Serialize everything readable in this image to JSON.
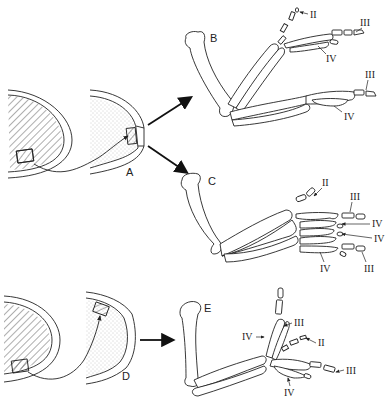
{
  "figure": {
    "panels": [
      {
        "id": "A",
        "label": "A",
        "content": "donor limb bud (hatched) with posterior tissue grafted into anterior margin of host limb bud (stippled)"
      },
      {
        "id": "B",
        "label": "B",
        "content": "resulting wing skeleton with mirror-duplicated digits",
        "digit_labels": [
          "II",
          "III",
          "IV",
          "III",
          "IV"
        ]
      },
      {
        "id": "C",
        "label": "C",
        "content": "resulting wing skeleton with multiple duplicated digits",
        "digit_labels": [
          "II",
          "III",
          "IV",
          "IV",
          "IV",
          "III"
        ]
      },
      {
        "id": "D",
        "label": "D",
        "content": "donor limb bud tissue grafted to apical/dorsal region of host limb bud"
      },
      {
        "id": "E",
        "label": "E",
        "content": "resulting wing skeleton with branched digits",
        "digit_labels": [
          "IV",
          "III",
          "II",
          "III",
          "IV"
        ]
      }
    ],
    "colors": {
      "ink": "#222222",
      "background": "#ffffff",
      "stipple": "#bdbdbd"
    }
  }
}
